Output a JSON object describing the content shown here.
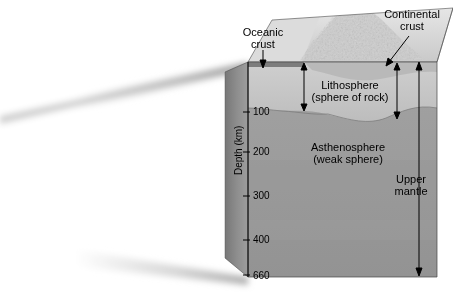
{
  "figure": {
    "type": "cross-section-block-diagram"
  },
  "axis": {
    "title": "Depth (km)",
    "ticks": [
      {
        "label": "100",
        "depth_km": 100
      },
      {
        "label": "200",
        "depth_km": 200
      },
      {
        "label": "300",
        "depth_km": 300
      },
      {
        "label": "400",
        "depth_km": 400
      },
      {
        "label": "660",
        "depth_km": 660
      }
    ]
  },
  "labels": {
    "oceanic_crust_line1": "Oceanic",
    "oceanic_crust_line2": "crust",
    "continental_crust_line1": "Continental",
    "continental_crust_line2": "crust",
    "lithosphere_line1": "Lithosphere",
    "lithosphere_line2": "(sphere of rock)",
    "asthenosphere_line1": "Asthenosphere",
    "asthenosphere_line2": "(weak sphere)",
    "upper_mantle_line1": "Upper",
    "upper_mantle_line2": "mantle"
  },
  "colors": {
    "lithosphere": "#c8c8c8",
    "asthenosphere": "#9b9b9b",
    "left_face": "#8e8e8e",
    "top_surface": "#d8d8d8",
    "outline": "#3a3a3a",
    "text": "#000000",
    "background": "#ffffff"
  },
  "icons": {
    "oceanic_arrow": "down-arrow-icon",
    "continental_arrow": "diagonal-arrow-icon",
    "lithosphere_span_left": "double-arrow-icon",
    "lithosphere_span_right": "double-arrow-icon",
    "upper_mantle_span": "double-arrow-icon"
  }
}
